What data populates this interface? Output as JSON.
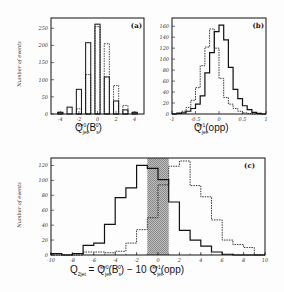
{
  "figure": {
    "ylabel": "Number of events",
    "panels": [
      {
        "id": "a",
        "label": "(a)",
        "xlabel_main": "Q",
        "xlabel_sub": "jet",
        "xlabel_sup": "κ=0",
        "xlabel_arg": "(B",
        "xlabel_arg_sub": "s",
        "xlabel_arg_sup": "0",
        "xlabel_close": ")"
      },
      {
        "id": "b",
        "label": "(b)",
        "xlabel_main": "Q",
        "xlabel_sub": "jet",
        "xlabel_sup": "κ=1",
        "xlabel_arg": "(opp)"
      },
      {
        "id": "c",
        "label": "(c)",
        "xlabel_text": "Q",
        "xlabel_sub": "2jet",
        "xlabel_eq": " = Q",
        "xlabel_sub2": "jet",
        "xlabel_sup2": "κ=0",
        "xlabel_arg": "(B",
        "xlabel_arg_sub": "s",
        "xlabel_arg_sup": "0",
        "xlabel_mid": ") − 10 Q",
        "xlabel_sub3": "jet",
        "xlabel_sup3": "κ=1",
        "xlabel_end": "(opp)"
      }
    ]
  },
  "chart_data": [
    {
      "type": "bar",
      "title": "(a)",
      "xlabel": "Q_jet^{κ=0}(B_s^0)",
      "ylabel": "Number of events",
      "xlim": [
        -5,
        5
      ],
      "ylim": [
        0,
        280
      ],
      "xticks": [
        -4,
        -2,
        0,
        2,
        4
      ],
      "yticks": [
        0,
        50,
        100,
        150,
        200,
        250
      ],
      "categories": [
        -4,
        -3,
        -2,
        -1,
        0,
        1,
        2,
        3,
        4
      ],
      "series": [
        {
          "name": "solid",
          "style": "solid",
          "values": [
            5,
            20,
            72,
            208,
            262,
            108,
            38,
            12,
            5
          ]
        },
        {
          "name": "dashed",
          "style": "dashed",
          "values": [
            5,
            0,
            15,
            115,
            255,
            205,
            83,
            25,
            5
          ]
        }
      ]
    },
    {
      "type": "line",
      "title": "(b)",
      "xlabel": "Q_jet^{κ=1}(opp)",
      "ylabel": "Number of events",
      "xlim": [
        -1,
        1
      ],
      "ylim": [
        0,
        175
      ],
      "xticks": [
        -1,
        -0.5,
        0,
        0.5,
        1
      ],
      "yticks": [
        0,
        20,
        40,
        60,
        80,
        100,
        120,
        140,
        160
      ],
      "bin_edges": [
        -1,
        -0.9,
        -0.8,
        -0.7,
        -0.6,
        -0.5,
        -0.4,
        -0.3,
        -0.2,
        -0.1,
        0,
        0.1,
        0.2,
        0.3,
        0.4,
        0.5,
        0.6,
        0.7,
        0.8,
        0.9,
        1
      ],
      "series": [
        {
          "name": "solid",
          "style": "solid",
          "values": [
            0,
            1,
            2,
            5,
            10,
            18,
            33,
            75,
            112,
            150,
            162,
            135,
            85,
            45,
            28,
            15,
            8,
            3,
            1,
            0
          ]
        },
        {
          "name": "dashed",
          "style": "dashed",
          "values": [
            0,
            2,
            5,
            12,
            25,
            48,
            88,
            122,
            155,
            120,
            65,
            30,
            18,
            10,
            5,
            2,
            1,
            0,
            0,
            0
          ]
        }
      ]
    },
    {
      "type": "line",
      "title": "(c)",
      "xlabel": "Q_2jet = Q_jet^{κ=0}(B_s^0) − 10 Q_jet^{κ=1}(opp)",
      "ylabel": "Number of events",
      "xlim": [
        -10,
        10
      ],
      "ylim": [
        0,
        130
      ],
      "xticks": [
        -10,
        -8,
        -6,
        -4,
        -2,
        0,
        2,
        4,
        6,
        8,
        10
      ],
      "yticks": [
        0,
        20,
        40,
        60,
        80,
        100,
        120
      ],
      "shaded_region": [
        -1,
        1
      ],
      "bin_edges": [
        -10,
        -9,
        -8,
        -7,
        -6,
        -5,
        -4,
        -3,
        -2,
        -1,
        0,
        1,
        2,
        3,
        4,
        5,
        6,
        7,
        8,
        9,
        10
      ],
      "series": [
        {
          "name": "solid",
          "style": "solid",
          "values": [
            2,
            0,
            2,
            13,
            16,
            41,
            77,
            90,
            120,
            116,
            101,
            71,
            33,
            20,
            12,
            4,
            1,
            0,
            0,
            0
          ]
        },
        {
          "name": "dashed",
          "style": "dashed",
          "values": [
            0,
            0,
            0,
            4,
            4,
            3,
            5,
            16,
            34,
            50,
            94,
            119,
            126,
            93,
            78,
            47,
            20,
            14,
            10,
            0
          ]
        }
      ]
    }
  ]
}
